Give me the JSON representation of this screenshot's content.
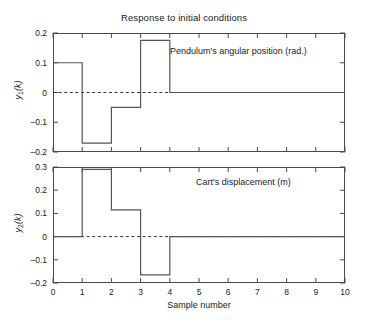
{
  "figure": {
    "title": "Response to initial conditions",
    "xlabel": "Sample number",
    "width": 368,
    "height": 330,
    "line_color": "#555555",
    "axis_color": "#4a4a4a",
    "background": "#ffffff"
  },
  "panels": [
    {
      "ylabel_main": "y",
      "ylabel_sub": "1",
      "ylabel_tail": "(k)",
      "annotation": "Pendulum's angular position (rad.)",
      "ytick_labels": [
        "0.2",
        "0.1",
        "0",
        "–0.1",
        "–0.2"
      ]
    },
    {
      "ylabel_main": "y",
      "ylabel_sub": "2",
      "ylabel_tail": "(k)",
      "annotation": "Cart's displacement (m)",
      "ytick_labels": [
        "0.3",
        "0.2",
        "0.1",
        "0",
        "–0.1",
        "–0.2"
      ]
    }
  ],
  "xtick_labels": [
    "0",
    "1",
    "2",
    "3",
    "4",
    "5",
    "6",
    "7",
    "8",
    "9",
    "10"
  ],
  "chart_data": [
    {
      "type": "line",
      "subtype": "stairs",
      "title": "Response to initial conditions",
      "name": "Pendulum's angular position (rad.)",
      "xlabel": "Sample number",
      "ylabel": "y1(k)",
      "xlim": [
        0,
        10
      ],
      "ylim": [
        -0.2,
        0.2
      ],
      "xticks": [
        0,
        1,
        2,
        3,
        4,
        5,
        6,
        7,
        8,
        9,
        10
      ],
      "yticks": [
        -0.2,
        -0.1,
        0,
        0.1,
        0.2
      ],
      "grid": false,
      "zero_reference_line": 0,
      "zero_reference_style": "dashed",
      "x": [
        0,
        1,
        2,
        3,
        4,
        5,
        6,
        7,
        8,
        9,
        10
      ],
      "values": [
        0.1,
        -0.17,
        -0.05,
        0.175,
        0,
        0,
        0,
        0,
        0,
        0,
        0
      ]
    },
    {
      "type": "line",
      "subtype": "stairs",
      "name": "Cart's displacement (m)",
      "xlabel": "Sample number",
      "ylabel": "y2(k)",
      "xlim": [
        0,
        10
      ],
      "ylim": [
        -0.2,
        0.3
      ],
      "xticks": [
        0,
        1,
        2,
        3,
        4,
        5,
        6,
        7,
        8,
        9,
        10
      ],
      "yticks": [
        -0.2,
        -0.1,
        0,
        0.1,
        0.2,
        0.3
      ],
      "grid": false,
      "zero_reference_line": 0,
      "zero_reference_style": "dashed",
      "x": [
        0,
        1,
        2,
        3,
        4,
        5,
        6,
        7,
        8,
        9,
        10
      ],
      "values": [
        0,
        0.29,
        0.115,
        -0.165,
        0,
        0,
        0,
        0,
        0,
        0,
        0
      ]
    }
  ]
}
